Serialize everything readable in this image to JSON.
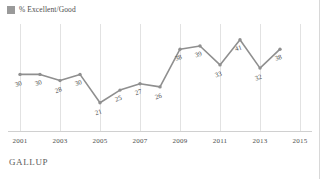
{
  "legend": {
    "swatch_name": "legend-swatch",
    "label": "% Excellent/Good",
    "color": "#9a9a9a"
  },
  "footer": {
    "brand": "GALLUP"
  },
  "chart_data": {
    "type": "line",
    "title": "",
    "subtitle": "",
    "xlabel": "",
    "ylabel": "",
    "grid": "vertical",
    "legend_position": "top-left",
    "series_color": "#8f8f8f",
    "xlim": [
      2000.4,
      2015.6
    ],
    "ylim": [
      12,
      46
    ],
    "tick_labels": [
      "2001",
      "2003",
      "2005",
      "2007",
      "2009",
      "2011",
      "2013",
      "2015"
    ],
    "tick_values": [
      2001,
      2003,
      2005,
      2007,
      2009,
      2011,
      2013,
      2015
    ],
    "x": [
      2001,
      2002,
      2003,
      2004,
      2005,
      2006,
      2007,
      2008,
      2009,
      2010,
      2011,
      2012,
      2013,
      2014
    ],
    "series": [
      {
        "name": "% Excellent/Good",
        "values": [
          30,
          30,
          28,
          30,
          21,
          25,
          27,
          26,
          38,
          39,
          33,
          41,
          32,
          38
        ],
        "labels": [
          "30",
          "30",
          "28",
          "30",
          "21",
          "25",
          "27",
          "26",
          "38",
          "39",
          "33",
          "41",
          "32",
          "38"
        ]
      }
    ]
  }
}
